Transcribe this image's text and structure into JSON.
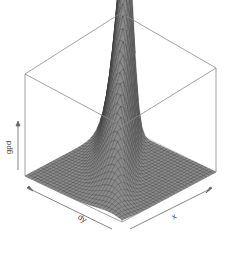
{
  "chart_data": {
    "type": "surface3d",
    "title": "",
    "xlabel": "x",
    "ylabel": "dy",
    "zlabel": "gpd",
    "box": true,
    "ticks": false,
    "surface_color": "#8a8a8a",
    "mesh_color": "#3a3a3a",
    "box_color": "#9a9a9a",
    "grid_resolution": 30
  },
  "labels": {
    "x": "x",
    "y": "dy",
    "z": "gpd"
  }
}
